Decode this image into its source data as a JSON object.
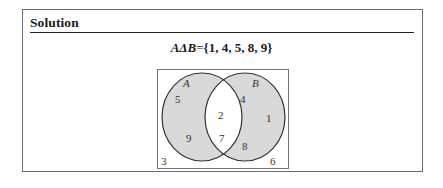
{
  "section": {
    "title": "Solution"
  },
  "formula": {
    "lhs": "AΔB",
    "equals": "=",
    "rhs": "{1, 4, 5, 8, 9}"
  },
  "venn": {
    "set_labels": {
      "a": "A",
      "b": "B"
    },
    "only_a": [
      "5",
      "9"
    ],
    "intersection": [
      "2",
      "7"
    ],
    "only_b": [
      "4",
      "1",
      "8"
    ],
    "outside": [
      "3",
      "6"
    ],
    "colors": {
      "shaded": "#d9d9d9",
      "unshaded": "#ffffff",
      "stroke": "#333333",
      "box_stroke": "#777777"
    }
  }
}
